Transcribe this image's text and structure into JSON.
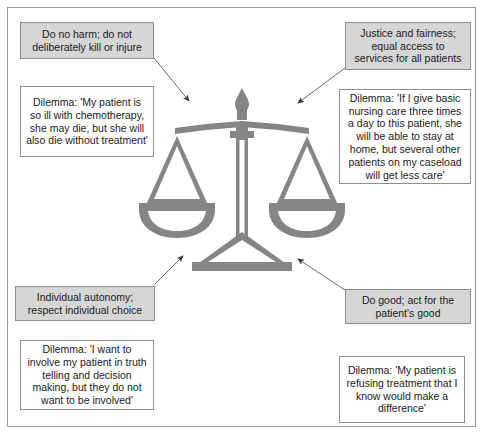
{
  "figure": {
    "type": "ethical-principles-diagram",
    "central_icon": "scales-of-justice-icon",
    "border_color": "#9a9a9a",
    "principle_fill": "#d6d6d6",
    "dilemma_fill": "#ffffff",
    "icon_color": "#848484",
    "arrow_color": "#555555"
  },
  "nodes": {
    "no_harm": {
      "kind": "principle",
      "text": "Do no harm; do not deliberately kill or injure"
    },
    "chemo_dilemma": {
      "kind": "dilemma",
      "text": "Dilemma: 'My patient is so ill with chemotherapy, she may die, but she will also die without treatment'"
    },
    "justice": {
      "kind": "principle",
      "text": "Justice and fairness; equal access to services for all patients"
    },
    "nursing_dilemma": {
      "kind": "dilemma",
      "text": "Dilemma: 'If I give basic nursing care three times a day to this patient, she will be able to stay at home, but several other patients on my caseload will get less care'"
    },
    "autonomy": {
      "kind": "principle",
      "text": "Individual autonomy; respect individual choice"
    },
    "truth_dilemma": {
      "kind": "dilemma",
      "text": "Dilemma: 'I want to involve my patient in truth telling and decision making, but they do not want to be involved'"
    },
    "do_good": {
      "kind": "principle",
      "text": "Do good; act for the patient's good"
    },
    "refusing_dilemma": {
      "kind": "dilemma",
      "text": "Dilemma: 'My patient is refusing treatment that I know would make a difference'"
    }
  },
  "arrows": [
    {
      "name": "arrow-no-harm-to-scales",
      "from": "no_harm",
      "to": "central_icon",
      "direction": "down-right"
    },
    {
      "name": "arrow-justice-to-scales",
      "from": "justice",
      "to": "central_icon",
      "direction": "down-left"
    },
    {
      "name": "arrow-autonomy-to-scales",
      "from": "autonomy",
      "to": "central_icon",
      "direction": "up-right"
    },
    {
      "name": "arrow-do-good-to-scales",
      "from": "do_good",
      "to": "central_icon",
      "direction": "up-left"
    }
  ]
}
